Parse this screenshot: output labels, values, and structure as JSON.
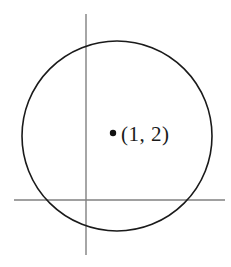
{
  "figure": {
    "title": "",
    "background_color": "#ffffff",
    "width": 231,
    "height": 267,
    "axes": {
      "line_color": "#808080",
      "line_width": 1.4,
      "origin": {
        "x": 86,
        "y": 200
      },
      "vertical": {
        "x": 86,
        "y_top": 14,
        "y_bottom": 255
      },
      "horizontal": {
        "y": 200,
        "x_left": 14,
        "x_right": 225
      }
    },
    "circle": {
      "stroke_color": "#1a1a1a",
      "fill": "none",
      "stroke_width": 1.6,
      "center_x": 117,
      "center_y": 136,
      "radius": 95
    },
    "marked_point": {
      "dot_color": "#111111",
      "dot_x": 113,
      "dot_y": 133,
      "dot_radius": 3.2,
      "label": "(1, 2)",
      "label_x": 121,
      "label_y": 124
    }
  },
  "chart_data": {
    "type": "scatter",
    "title": "",
    "xlabel": "",
    "ylabel": "",
    "grid": false,
    "legend": null,
    "annotations": [
      {
        "text": "(1, 2)",
        "x": 1,
        "y": 2
      }
    ],
    "series": [
      {
        "name": "marked point",
        "type": "scatter",
        "x": [
          1
        ],
        "y": [
          2
        ],
        "labels": [
          "(1, 2)"
        ]
      },
      {
        "name": "circle",
        "type": "shape",
        "shape": "circle",
        "center": [
          1,
          2
        ],
        "radius": 3
      }
    ],
    "axis_lines": {
      "x_axis": 0,
      "y_axis": 0
    }
  }
}
